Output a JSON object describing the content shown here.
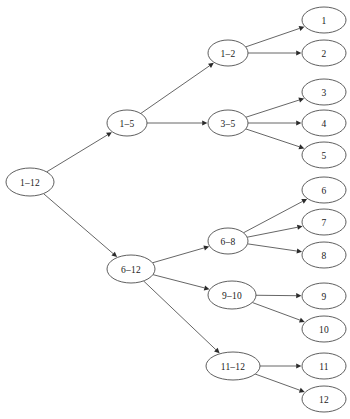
{
  "diagram": {
    "type": "tree-diagram",
    "background_color": "#ffffff",
    "node_fill_color": "#ffffff",
    "node_stroke_color": "#4d4d4d",
    "edge_color": "#555555",
    "label_color": "#1a1a1a",
    "nodes": [
      {
        "id": "n1_12",
        "label": "1–12",
        "cx": 30,
        "cy": 182,
        "rx": 24,
        "ry": 14,
        "level": 0
      },
      {
        "id": "n1_5",
        "label": "1–5",
        "cx": 127,
        "cy": 123,
        "rx": 20,
        "ry": 13,
        "level": 1
      },
      {
        "id": "n6_12",
        "label": "6–12",
        "cx": 131,
        "cy": 269,
        "rx": 24,
        "ry": 14,
        "level": 1
      },
      {
        "id": "n1_2",
        "label": "1–2",
        "cx": 228,
        "cy": 53,
        "rx": 20,
        "ry": 13,
        "level": 2
      },
      {
        "id": "n3_5",
        "label": "3–5",
        "cx": 228,
        "cy": 123,
        "rx": 20,
        "ry": 13,
        "level": 2
      },
      {
        "id": "n6_8",
        "label": "6–8",
        "cx": 228,
        "cy": 241,
        "rx": 20,
        "ry": 13,
        "level": 2
      },
      {
        "id": "n9_10",
        "label": "9–10",
        "cx": 232,
        "cy": 295,
        "rx": 24,
        "ry": 14,
        "level": 2
      },
      {
        "id": "n11_12",
        "label": "11–12",
        "cx": 233,
        "cy": 366,
        "rx": 27,
        "ry": 14,
        "level": 2
      },
      {
        "id": "l1",
        "label": "1",
        "cx": 324,
        "cy": 20,
        "rx": 22,
        "ry": 13,
        "level": 3
      },
      {
        "id": "l2",
        "label": "2",
        "cx": 324,
        "cy": 53,
        "rx": 22,
        "ry": 13,
        "level": 3
      },
      {
        "id": "l3",
        "label": "3",
        "cx": 324,
        "cy": 92,
        "rx": 22,
        "ry": 13,
        "level": 3
      },
      {
        "id": "l4",
        "label": "4",
        "cx": 324,
        "cy": 123,
        "rx": 22,
        "ry": 13,
        "level": 3
      },
      {
        "id": "l5",
        "label": "5",
        "cx": 324,
        "cy": 155,
        "rx": 22,
        "ry": 13,
        "level": 3
      },
      {
        "id": "l6",
        "label": "6",
        "cx": 324,
        "cy": 190,
        "rx": 22,
        "ry": 13,
        "level": 3
      },
      {
        "id": "l7",
        "label": "7",
        "cx": 324,
        "cy": 222,
        "rx": 22,
        "ry": 13,
        "level": 3
      },
      {
        "id": "l8",
        "label": "8",
        "cx": 324,
        "cy": 255,
        "rx": 22,
        "ry": 13,
        "level": 3
      },
      {
        "id": "l9",
        "label": "9",
        "cx": 324,
        "cy": 296,
        "rx": 22,
        "ry": 13,
        "level": 3
      },
      {
        "id": "l10",
        "label": "10",
        "cx": 324,
        "cy": 329,
        "rx": 22,
        "ry": 13,
        "level": 3
      },
      {
        "id": "l11",
        "label": "11",
        "cx": 324,
        "cy": 366,
        "rx": 22,
        "ry": 13,
        "level": 3
      },
      {
        "id": "l12",
        "label": "12",
        "cx": 324,
        "cy": 399,
        "rx": 22,
        "ry": 13,
        "level": 3
      }
    ],
    "edges": [
      {
        "from": "n1_12",
        "to": "n1_5"
      },
      {
        "from": "n1_12",
        "to": "n6_12"
      },
      {
        "from": "n1_5",
        "to": "n1_2"
      },
      {
        "from": "n1_5",
        "to": "n3_5"
      },
      {
        "from": "n6_12",
        "to": "n6_8"
      },
      {
        "from": "n6_12",
        "to": "n9_10"
      },
      {
        "from": "n6_12",
        "to": "n11_12"
      },
      {
        "from": "n1_2",
        "to": "l1"
      },
      {
        "from": "n1_2",
        "to": "l2"
      },
      {
        "from": "n3_5",
        "to": "l3"
      },
      {
        "from": "n3_5",
        "to": "l4"
      },
      {
        "from": "n3_5",
        "to": "l5"
      },
      {
        "from": "n6_8",
        "to": "l6"
      },
      {
        "from": "n6_8",
        "to": "l7"
      },
      {
        "from": "n6_8",
        "to": "l8"
      },
      {
        "from": "n9_10",
        "to": "l9"
      },
      {
        "from": "n9_10",
        "to": "l10"
      },
      {
        "from": "n11_12",
        "to": "l11"
      },
      {
        "from": "n11_12",
        "to": "l12"
      }
    ]
  }
}
